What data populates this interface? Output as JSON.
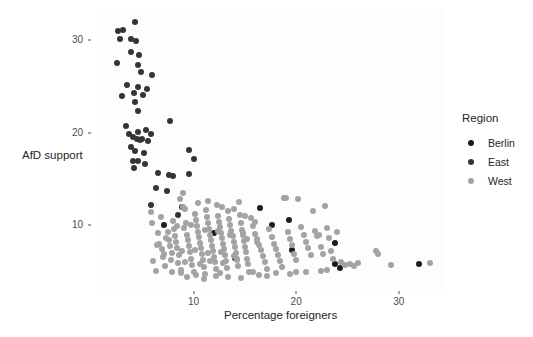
{
  "chart_data": {
    "type": "scatter",
    "title": "",
    "xlabel": "Percentage foreigners",
    "ylabel": "AfD support",
    "xlim": [
      0.5,
      34.5
    ],
    "ylim": [
      3.0,
      33.5
    ],
    "xticks": [
      10,
      20,
      30
    ],
    "yticks": [
      10,
      20,
      30
    ],
    "grid": false,
    "legend": {
      "title": "Region",
      "position": "right",
      "entries": [
        {
          "label": "Berlin",
          "color": "#1c1c1c"
        },
        {
          "label": "East",
          "color": "#353535"
        },
        {
          "label": "West",
          "color": "#a3a3a3"
        }
      ]
    },
    "series": [
      {
        "name": "East",
        "color": "#353535",
        "points": [
          [
            2.6,
            31.0
          ],
          [
            3.1,
            31.1
          ],
          [
            4.3,
            32.0
          ],
          [
            2.8,
            30.1
          ],
          [
            3.9,
            30.2
          ],
          [
            4.4,
            29.9
          ],
          [
            3.9,
            28.7
          ],
          [
            4.7,
            28.4
          ],
          [
            2.5,
            27.6
          ],
          [
            4.6,
            27.3
          ],
          [
            4.9,
            26.6
          ],
          [
            6.0,
            26.3
          ],
          [
            3.5,
            25.2
          ],
          [
            4.6,
            25.0
          ],
          [
            5.5,
            24.7
          ],
          [
            3.0,
            24.0
          ],
          [
            4.2,
            24.3
          ],
          [
            5.1,
            24.1
          ],
          [
            4.3,
            23.3
          ],
          [
            4.6,
            22.4
          ],
          [
            3.4,
            20.7
          ],
          [
            3.7,
            19.9
          ],
          [
            4.6,
            20.1
          ],
          [
            5.4,
            20.3
          ],
          [
            5.9,
            19.9
          ],
          [
            4.1,
            19.5
          ],
          [
            4.5,
            19.3
          ],
          [
            4.8,
            19.2
          ],
          [
            5.0,
            19.3
          ],
          [
            5.6,
            19.1
          ],
          [
            3.9,
            18.5
          ],
          [
            4.3,
            18.0
          ],
          [
            5.2,
            17.8
          ],
          [
            7.7,
            21.3
          ],
          [
            9.6,
            18.1
          ],
          [
            4.1,
            17.0
          ],
          [
            4.6,
            16.9
          ],
          [
            5.3,
            16.6
          ],
          [
            10.0,
            17.2
          ],
          [
            7.6,
            15.4
          ],
          [
            8.0,
            15.3
          ],
          [
            6.5,
            15.7
          ],
          [
            9.6,
            15.5
          ],
          [
            5.9,
            12.2
          ],
          [
            7.4,
            13.7
          ],
          [
            8.9,
            12.0
          ],
          [
            8.5,
            11.1
          ],
          [
            4.2,
            16.2
          ],
          [
            6.3,
            14.0
          ]
        ]
      },
      {
        "name": "Berlin",
        "color": "#1c1c1c",
        "points": [
          [
            7.1,
            10.0
          ],
          [
            12.0,
            9.2
          ],
          [
            16.5,
            11.9
          ],
          [
            17.6,
            10.0
          ],
          [
            19.3,
            10.6
          ],
          [
            19.6,
            7.3
          ],
          [
            14.0,
            6.5
          ],
          [
            23.8,
            8.1
          ],
          [
            23.8,
            5.8
          ],
          [
            24.3,
            5.4
          ],
          [
            32.0,
            5.8
          ]
        ]
      },
      {
        "name": "West",
        "color": "#a3a3a3",
        "points": [
          [
            5.9,
            11.4
          ],
          [
            6.0,
            10.2
          ],
          [
            6.5,
            9.2
          ],
          [
            6.6,
            8.0
          ],
          [
            6.9,
            7.4
          ],
          [
            7.0,
            6.6
          ],
          [
            7.2,
            5.6
          ],
          [
            6.1,
            6.1
          ],
          [
            6.3,
            5.1
          ],
          [
            7.5,
            9.3
          ],
          [
            7.6,
            8.4
          ],
          [
            7.7,
            7.8
          ],
          [
            7.9,
            7.0
          ],
          [
            7.8,
            6.2
          ],
          [
            8.1,
            9.6
          ],
          [
            8.2,
            8.8
          ],
          [
            8.3,
            8.2
          ],
          [
            8.4,
            7.5
          ],
          [
            8.6,
            6.8
          ],
          [
            8.5,
            5.9
          ],
          [
            8.8,
            5.2
          ],
          [
            9.0,
            13.5
          ],
          [
            8.7,
            12.8
          ],
          [
            9.2,
            11.8
          ],
          [
            9.3,
            10.3
          ],
          [
            9.1,
            9.7
          ],
          [
            9.4,
            9.0
          ],
          [
            9.5,
            8.4
          ],
          [
            9.6,
            7.8
          ],
          [
            9.7,
            7.1
          ],
          [
            9.8,
            6.4
          ],
          [
            9.9,
            5.7
          ],
          [
            10.0,
            5.0
          ],
          [
            10.1,
            11.2
          ],
          [
            10.2,
            10.6
          ],
          [
            10.3,
            9.9
          ],
          [
            10.4,
            9.3
          ],
          [
            10.5,
            8.7
          ],
          [
            10.6,
            8.1
          ],
          [
            10.7,
            7.5
          ],
          [
            10.8,
            6.9
          ],
          [
            10.9,
            6.2
          ],
          [
            11.0,
            5.5
          ],
          [
            11.1,
            4.7
          ],
          [
            11.2,
            11.6
          ],
          [
            11.3,
            10.9
          ],
          [
            11.4,
            10.2
          ],
          [
            11.5,
            9.6
          ],
          [
            11.6,
            9.0
          ],
          [
            11.7,
            8.4
          ],
          [
            11.8,
            7.8
          ],
          [
            11.9,
            7.2
          ],
          [
            12.0,
            6.6
          ],
          [
            12.1,
            6.0
          ],
          [
            12.2,
            5.3
          ],
          [
            12.3,
            12.2
          ],
          [
            12.4,
            11.0
          ],
          [
            12.5,
            10.4
          ],
          [
            12.6,
            9.8
          ],
          [
            12.7,
            9.2
          ],
          [
            12.8,
            8.6
          ],
          [
            12.9,
            8.0
          ],
          [
            13.0,
            7.4
          ],
          [
            13.1,
            6.8
          ],
          [
            13.2,
            6.1
          ],
          [
            13.3,
            5.4
          ],
          [
            13.4,
            11.5
          ],
          [
            13.5,
            10.7
          ],
          [
            13.6,
            10.0
          ],
          [
            13.7,
            9.4
          ],
          [
            13.8,
            8.8
          ],
          [
            13.9,
            8.2
          ],
          [
            14.0,
            7.6
          ],
          [
            14.1,
            7.0
          ],
          [
            14.2,
            6.3
          ],
          [
            14.3,
            5.6
          ],
          [
            14.4,
            12.5
          ],
          [
            14.5,
            11.1
          ],
          [
            14.6,
            10.3
          ],
          [
            14.7,
            9.5
          ],
          [
            14.8,
            8.9
          ],
          [
            14.9,
            8.3
          ],
          [
            15.0,
            7.7
          ],
          [
            15.1,
            7.1
          ],
          [
            15.2,
            6.4
          ],
          [
            15.3,
            5.8
          ],
          [
            15.4,
            4.9
          ],
          [
            15.6,
            10.8
          ],
          [
            15.8,
            9.9
          ],
          [
            16.0,
            9.1
          ],
          [
            16.2,
            8.5
          ],
          [
            16.4,
            7.9
          ],
          [
            16.6,
            7.3
          ],
          [
            16.8,
            6.7
          ],
          [
            17.0,
            6.0
          ],
          [
            17.2,
            5.3
          ],
          [
            17.4,
            9.6
          ],
          [
            17.6,
            8.7
          ],
          [
            17.8,
            8.0
          ],
          [
            18.0,
            7.4
          ],
          [
            18.2,
            6.8
          ],
          [
            18.4,
            6.1
          ],
          [
            18.6,
            5.5
          ],
          [
            18.8,
            13.0
          ],
          [
            19.0,
            12.9
          ],
          [
            19.2,
            9.3
          ],
          [
            19.4,
            8.5
          ],
          [
            19.6,
            7.9
          ],
          [
            19.8,
            6.9
          ],
          [
            20.0,
            6.2
          ],
          [
            20.2,
            12.8
          ],
          [
            20.5,
            9.8
          ],
          [
            20.8,
            9.0
          ],
          [
            21.0,
            8.2
          ],
          [
            21.2,
            7.5
          ],
          [
            21.4,
            6.8
          ],
          [
            21.6,
            11.5
          ],
          [
            21.8,
            9.4
          ],
          [
            22.0,
            8.8
          ],
          [
            22.2,
            8.9
          ],
          [
            22.4,
            7.6
          ],
          [
            22.6,
            6.9
          ],
          [
            22.8,
            12.1
          ],
          [
            23.0,
            9.7
          ],
          [
            23.2,
            8.6
          ],
          [
            23.4,
            7.2
          ],
          [
            23.6,
            6.3
          ],
          [
            24.0,
            9.3
          ],
          [
            24.4,
            6.0
          ],
          [
            24.8,
            5.7
          ],
          [
            25.2,
            5.8
          ],
          [
            25.6,
            5.6
          ],
          [
            26.0,
            5.9
          ],
          [
            27.8,
            7.2
          ],
          [
            28.0,
            6.9
          ],
          [
            29.2,
            5.7
          ],
          [
            33.0,
            5.9
          ],
          [
            6.8,
            10.9
          ],
          [
            8.0,
            10.5
          ],
          [
            9.0,
            12.0
          ],
          [
            10.4,
            12.4
          ],
          [
            11.4,
            12.6
          ],
          [
            12.8,
            12.0
          ],
          [
            13.9,
            11.8
          ],
          [
            15.0,
            11.0
          ],
          [
            16.0,
            10.4
          ],
          [
            12.2,
            4.5
          ],
          [
            13.4,
            4.4
          ],
          [
            14.6,
            4.3
          ],
          [
            16.4,
            4.6
          ],
          [
            18.0,
            4.8
          ],
          [
            19.4,
            4.7
          ],
          [
            21.0,
            4.9
          ],
          [
            22.4,
            5.1
          ],
          [
            11.0,
            4.2
          ],
          [
            10.2,
            4.6
          ],
          [
            8.8,
            4.8
          ],
          [
            7.9,
            5.0
          ],
          [
            9.4,
            4.4
          ],
          [
            12.6,
            4.8
          ],
          [
            15.8,
            4.9
          ],
          [
            17.2,
            4.5
          ],
          [
            23.0,
            5.2
          ],
          [
            20.0,
            5.0
          ],
          [
            9.2,
            6.0
          ],
          [
            10.6,
            5.8
          ],
          [
            11.6,
            6.1
          ],
          [
            12.9,
            5.9
          ],
          [
            14.2,
            6.2
          ],
          [
            8.4,
            9.9
          ],
          [
            9.8,
            10.0
          ],
          [
            11.1,
            9.5
          ],
          [
            12.4,
            9.4
          ],
          [
            13.6,
            9.0
          ],
          [
            14.8,
            9.2
          ],
          [
            16.2,
            8.2
          ],
          [
            7.3,
            8.6
          ],
          [
            8.9,
            7.2
          ],
          [
            10.1,
            7.3
          ],
          [
            11.4,
            7.0
          ],
          [
            12.7,
            7.1
          ],
          [
            13.9,
            6.7
          ],
          [
            15.2,
            8.5
          ],
          [
            6.4,
            7.9
          ],
          [
            7.1,
            6.9
          ]
        ]
      }
    ]
  },
  "axes": {
    "y_ticks": [
      "10",
      "20",
      "30"
    ],
    "x_ticks": [
      "10",
      "20",
      "30"
    ],
    "y_title": "AfD support",
    "x_title": "Percentage foreigners"
  },
  "legend": {
    "title": "Region",
    "items": [
      {
        "label": "Berlin"
      },
      {
        "label": "East"
      },
      {
        "label": "West"
      }
    ]
  },
  "theme": {
    "panel_background": "#fdfdfd",
    "page_background": "#ffffff",
    "text_color": "#262626",
    "tick_color": "#4d4d4d"
  }
}
